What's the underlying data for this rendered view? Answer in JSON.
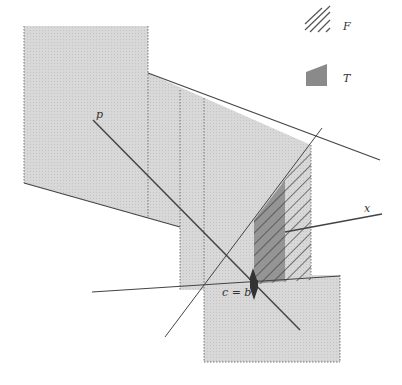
{
  "legend": {
    "items": [
      {
        "symbol": "hatched",
        "label": "F"
      },
      {
        "symbol": "dark-shaded",
        "label": "T"
      }
    ]
  },
  "labels": {
    "p": "p",
    "x": "x",
    "cb": "c = b"
  },
  "colors": {
    "region_fill": "#d6d6d6",
    "dark_fill": "#8c8c8c",
    "line": "#444444",
    "hatch": "#555555"
  }
}
